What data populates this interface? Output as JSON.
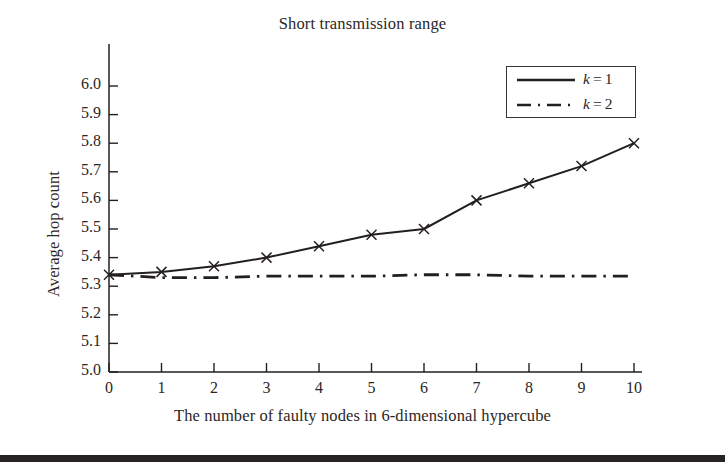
{
  "figure": {
    "title": "Short transmission range",
    "bottom_bar_color": "#272425",
    "line_color": "#231f20",
    "background": "#ffffff"
  },
  "legend": {
    "position": "top-right",
    "entries": [
      {
        "label": "k = 1",
        "symbol": "k",
        "value": "1",
        "style": "solid"
      },
      {
        "label": "k = 2",
        "symbol": "k",
        "value": "2",
        "style": "dash-dot"
      }
    ]
  },
  "axes": {
    "x": {
      "title": "The number of faulty nodes in 6-dimensional hypercube",
      "ticks": [
        "0",
        "1",
        "2",
        "3",
        "4",
        "5",
        "6",
        "7",
        "8",
        "9",
        "10"
      ],
      "min": 0,
      "max": 10
    },
    "y": {
      "title": "Average hop count",
      "ticks": [
        "5.0",
        "5.1",
        "5.2",
        "5.3",
        "5.4",
        "5.5",
        "5.6",
        "5.7",
        "5.8",
        "5.9",
        "6.0"
      ],
      "min": 5.0,
      "max": 6.0
    }
  },
  "chart_data": {
    "type": "line",
    "title": "Short transmission range",
    "xlabel": "The number of faulty nodes in 6-dimensional hypercube",
    "ylabel": "Average hop count",
    "x": [
      0,
      1,
      2,
      3,
      4,
      5,
      6,
      7,
      8,
      9,
      10
    ],
    "xlim": [
      0,
      10
    ],
    "ylim": [
      5.0,
      6.0
    ],
    "xticks": [
      0,
      1,
      2,
      3,
      4,
      5,
      6,
      7,
      8,
      9,
      10
    ],
    "yticks": [
      5.0,
      5.1,
      5.2,
      5.3,
      5.4,
      5.5,
      5.6,
      5.7,
      5.8,
      5.9,
      6.0
    ],
    "grid": false,
    "legend_position": "upper right",
    "series": [
      {
        "name": "k = 1",
        "style": "solid",
        "marker": "x",
        "values": [
          5.34,
          5.35,
          5.37,
          5.4,
          5.44,
          5.48,
          5.5,
          5.6,
          5.66,
          5.72,
          5.8
        ]
      },
      {
        "name": "k = 2",
        "style": "dash-dot",
        "marker": "none",
        "values": [
          5.34,
          5.33,
          5.33,
          5.335,
          5.335,
          5.335,
          5.34,
          5.34,
          5.335,
          5.335,
          5.335
        ]
      }
    ]
  }
}
